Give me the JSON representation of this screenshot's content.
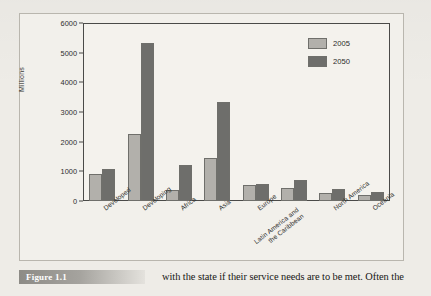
{
  "figure": {
    "caption_label": "Figure 1.1",
    "body_text": "with the state if their service needs are to be met. Often the"
  },
  "chart_data": {
    "type": "bar",
    "title": "",
    "xlabel": "",
    "ylabel": "Millions",
    "ylim": [
      0,
      6000
    ],
    "ytick_labels": [
      "6000",
      "5000",
      "4000",
      "3000",
      "2000",
      "1000",
      "0"
    ],
    "ytick_values": [
      6000,
      5000,
      4000,
      3000,
      2000,
      1000,
      0
    ],
    "grid": false,
    "legend_position": "top-right",
    "categories": [
      "Developed",
      "Developing",
      "Africa",
      "Asia",
      "Europe",
      "Latin America and\nthe Caribbean",
      "North America",
      "Oceania"
    ],
    "series": [
      {
        "name": "2005",
        "color": "#b2b0ab",
        "values": [
          920,
          2270,
          360,
          1450,
          525,
          430,
          265,
          215
        ]
      },
      {
        "name": "2050",
        "color": "#6e6e6b",
        "values": [
          1090,
          5320,
          1230,
          3340,
          560,
          700,
          400,
          310
        ]
      }
    ]
  },
  "legend": {
    "entries": [
      {
        "label": "2005"
      },
      {
        "label": "2050"
      }
    ]
  },
  "colors": {
    "series_2005": "#b2b0ab",
    "series_2050": "#6e6e6b",
    "axis": "#4a4a48",
    "page": "#eeece7"
  }
}
